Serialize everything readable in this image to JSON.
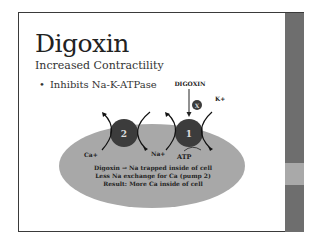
{
  "slide": {
    "title": "Digoxin",
    "subtitle": "Increased Contractility",
    "bullets": [
      {
        "marker": "•",
        "text": "Inhibits  Na-K-ATPase"
      }
    ]
  },
  "diagram": {
    "drug_label": "DIGOXIN",
    "block_symbol": "X",
    "k_label": "K+",
    "pump1_label": "1",
    "pump2_label": "2",
    "ca_label": "Ca+",
    "na_label": "Na+",
    "atp_label": "ATP",
    "cell_text": [
      "Digoxin → Na trapped inside of cell",
      "Less Na exchange for Ca (pump 2)",
      "Result: More Ca inside of cell"
    ]
  },
  "colors": {
    "sidebar": "#6e6e6e",
    "sidebar_accent": "#a9a9a9",
    "cell": "#a8a8a8",
    "pump": "#3c3c3c"
  }
}
